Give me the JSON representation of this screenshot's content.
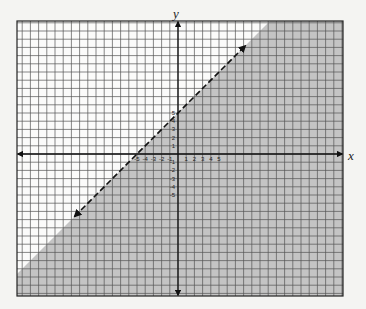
{
  "chart_data": {
    "type": "inequality-graph",
    "title": "",
    "xlabel": "x",
    "ylabel": "y",
    "boundary_line": {
      "equation": "y = x + 5",
      "slope": 1,
      "intercept": 5,
      "style": "dashed",
      "arrows": "both",
      "drawn_from_x": -12.6,
      "drawn_to_x": 8.2
    },
    "inequality": "y < x + 5",
    "shaded_region": "below-right of line",
    "x_tick_labels": [
      "-5",
      "-4",
      "-3",
      "-2",
      "-1",
      "1",
      "2",
      "3",
      "4",
      "5"
    ],
    "y_tick_labels": [
      "5",
      "4",
      "3",
      "2",
      "1",
      "-1",
      "-2",
      "-3",
      "-4",
      "-5"
    ],
    "x_ticks": [
      -5,
      -4,
      -3,
      -2,
      -1,
      1,
      2,
      3,
      4,
      5
    ],
    "y_ticks": [
      5,
      4,
      3,
      2,
      1,
      -1,
      -2,
      -3,
      -4,
      -5
    ],
    "grid": true,
    "xlim": [
      -19.5,
      20
    ],
    "ylim": [
      -17,
      16.2
    ],
    "colors": {
      "background": "#f4f4f2",
      "grid_line": "#555555",
      "shade": "#c4c4c4",
      "axis": "#111111",
      "boundary": "#111111"
    }
  },
  "layout": {
    "frame": {
      "left": 17,
      "top": 21,
      "right": 343,
      "bottom": 296
    },
    "origin": {
      "x": 178,
      "y": 154
    },
    "unit_px": 8.2
  }
}
